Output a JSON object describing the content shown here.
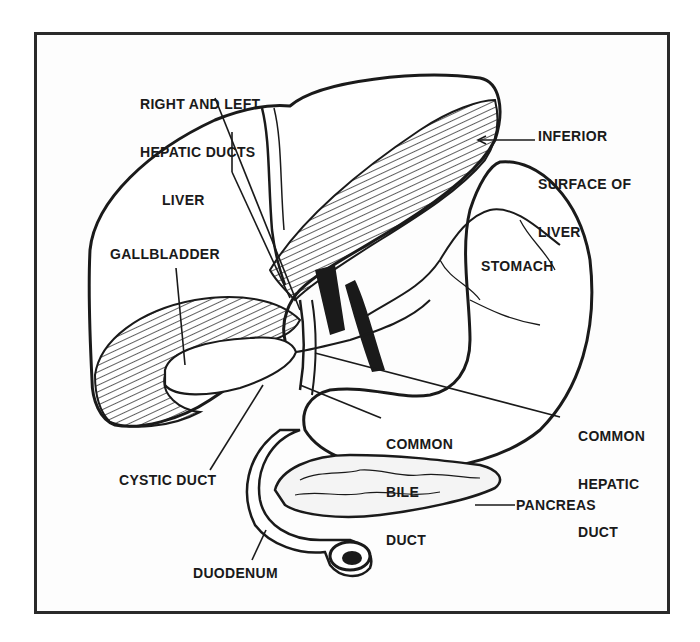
{
  "figure": {
    "type": "anatomical-illustration",
    "colors": {
      "ink": "#1a1a1a",
      "background": "#ffffff",
      "frame": "#2a2a2a"
    }
  },
  "labels": {
    "hepatic_ducts": {
      "line1": "RIGHT AND LEFT",
      "line2": "HEPATIC DUCTS"
    },
    "inferior_surface": {
      "line1": "INFERIOR",
      "line2": "SURFACE OF",
      "line3": "LIVER"
    },
    "liver": "LIVER",
    "gallbladder": "GALLBLADDER",
    "stomach": "STOMACH",
    "common_bile_duct": {
      "line1": "COMMON",
      "line2": "BILE",
      "line3": "DUCT"
    },
    "common_hepatic_duct": {
      "line1": "COMMON",
      "line2": "HEPATIC",
      "line3": "DUCT"
    },
    "cystic_duct": "CYSTIC DUCT",
    "pancreas": "PANCREAS",
    "duodenum": "DUODENUM"
  }
}
